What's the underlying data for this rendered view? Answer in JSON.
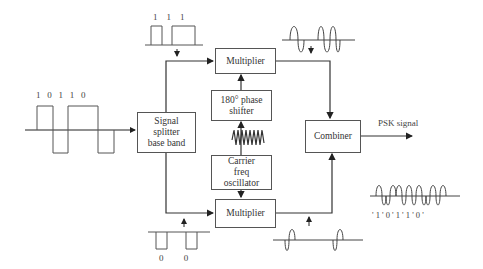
{
  "diagram": {
    "type": "block-diagram",
    "blocks": {
      "splitter": "Signal\nsplitter\nbase band",
      "multiplier_top": "Multiplier",
      "phase_shifter": "180° phase\nshifter",
      "oscillator": "Carrier\nfreq\noscillator",
      "multiplier_bottom": "Multiplier",
      "combiner": "Combiner"
    },
    "labels": {
      "input_bits": "1   0   1   1   0",
      "top_bits": "1    1    1",
      "bottom_bits": "0         0",
      "output": "PSK signal",
      "psk_bits": "' 1 ' 0 ' 1 ' 1 ' 0 '"
    },
    "input_bit_sequence": [
      "1",
      "0",
      "1",
      "1",
      "0"
    ],
    "top_branch_bits": [
      "1",
      "1",
      "1"
    ],
    "bottom_branch_bits": [
      "0",
      "0"
    ],
    "colors": {
      "line": "#444444",
      "text": "#333333",
      "background": "#ffffff"
    }
  }
}
